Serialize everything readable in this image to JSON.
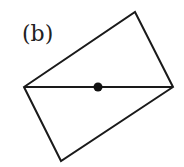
{
  "figure": {
    "label": "(b)",
    "stroke_color": "#1a1a1a",
    "fill_color": "#ffffff",
    "dot_color": "#111111",
    "rectangle": {
      "vertices": [
        {
          "name": "top",
          "x": 135,
          "y": 12
        },
        {
          "name": "right",
          "x": 173,
          "y": 87
        },
        {
          "name": "bottom",
          "x": 61,
          "y": 161
        },
        {
          "name": "left",
          "x": 24,
          "y": 87
        }
      ]
    },
    "diagonal": {
      "x1": 24,
      "y1": 87,
      "x2": 173,
      "y2": 87
    },
    "center_dot": {
      "cx": 98,
      "cy": 87,
      "r": 4.5
    }
  }
}
